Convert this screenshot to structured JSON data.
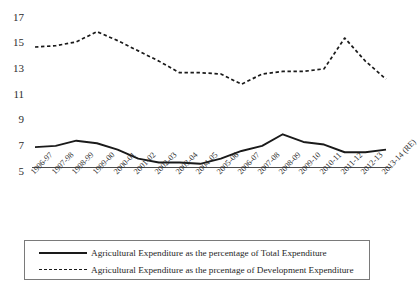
{
  "chart_data": {
    "type": "line",
    "title": "",
    "subtitle": "",
    "xlabel": "",
    "ylabel": "",
    "ylim": [
      5,
      17
    ],
    "yticks": [
      5,
      7,
      9,
      11,
      13,
      15,
      17
    ],
    "grid": false,
    "legend_position": "bottom",
    "categories": [
      "1996-97",
      "1997-98",
      "1998-99",
      "1999-00",
      "2000-01",
      "2001-02",
      "2002-03",
      "2003-04",
      "2004-05",
      "2005-06",
      "2006-07",
      "2007-08",
      "2008-09",
      "2009-10",
      "2010-11",
      "2011-12",
      "2012-13",
      "2013-14 (RE)"
    ],
    "series": [
      {
        "name": "Agricultural Expenditure as the percentage of Total Expenditure",
        "style": "solid",
        "color": "#1a1a1a",
        "values": [
          6.9,
          7.0,
          7.4,
          7.2,
          6.7,
          6.0,
          5.7,
          5.7,
          5.6,
          6.0,
          6.6,
          7.0,
          7.9,
          7.3,
          7.1,
          6.5,
          6.5,
          6.7
        ]
      },
      {
        "name": "Agricultural Expenditure as the prcentage of Development Expenditure",
        "style": "dashed",
        "color": "#1a1a1a",
        "values": [
          14.7,
          14.8,
          15.1,
          15.9,
          15.2,
          14.4,
          13.6,
          12.7,
          12.7,
          12.6,
          11.8,
          12.6,
          12.8,
          12.8,
          13.0,
          15.4,
          13.6,
          12.2
        ]
      }
    ],
    "legend": [
      {
        "key": "solid-line-key",
        "label": "Agricultural Expenditure as the percentage of Total Expenditure"
      },
      {
        "key": "dashed-line-key",
        "label": "Agricultural Expenditure as the prcentage of Development Expenditure"
      }
    ]
  }
}
